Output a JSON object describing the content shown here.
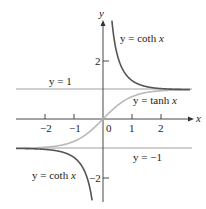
{
  "chart_data": {
    "type": "line",
    "title": "",
    "xlabel": "x",
    "ylabel": "y",
    "xlim": [
      -3.1,
      3.0
    ],
    "ylim": [
      -3.2,
      3.5
    ],
    "x_ticks": [
      "-2",
      "-1",
      "0",
      "1",
      "2"
    ],
    "y_ticks": [
      "2",
      "-2"
    ],
    "series": [
      {
        "name": "y = coth x",
        "color": "#555555",
        "function": "coth(x)",
        "domain": "x != 0"
      },
      {
        "name": "y = tanh x",
        "color": "#b5b5b5",
        "function": "tanh(x)"
      }
    ],
    "asymptotes": [
      {
        "label": "y = 1",
        "y": 1
      },
      {
        "label": "y = -1",
        "y": -1
      }
    ],
    "annotations": [
      "y = coth x",
      "y = tanh x",
      "y = coth x",
      "y = 1",
      "y = −1"
    ]
  },
  "labels": {
    "coth_upper_pre": "y = coth ",
    "coth_upper_var": "x",
    "coth_lower_pre": "y = coth ",
    "coth_lower_var": "x",
    "tanh_pre": "y = tanh ",
    "tanh_var": "x",
    "asym_pos": "y = 1",
    "asym_neg": "y = −1",
    "x_axis": "x",
    "y_axis": "y",
    "tick_x_m2": "−2",
    "tick_x_m1": "−1",
    "tick_x_0": "0",
    "tick_x_1": "1",
    "tick_x_2": "2",
    "tick_y_2": "2",
    "tick_y_m2": "−2"
  }
}
